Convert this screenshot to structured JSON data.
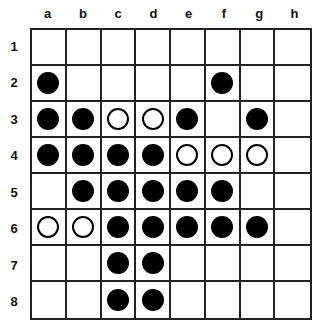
{
  "board": {
    "columns": [
      "a",
      "b",
      "c",
      "d",
      "e",
      "f",
      "g",
      "h"
    ],
    "rows": [
      "1",
      "2",
      "3",
      "4",
      "5",
      "6",
      "7",
      "8"
    ],
    "colors": {
      "black": "#000000",
      "white": "#ffffff",
      "grid": "#222222"
    },
    "cells": [
      [
        "",
        "",
        "",
        "",
        "",
        "",
        "",
        ""
      ],
      [
        "B",
        "",
        "",
        "",
        "",
        "B",
        "",
        ""
      ],
      [
        "B",
        "B",
        "W",
        "W",
        "B",
        "",
        "B",
        ""
      ],
      [
        "B",
        "B",
        "B",
        "B",
        "W",
        "W",
        "W",
        ""
      ],
      [
        "",
        "B",
        "B",
        "B",
        "B",
        "B",
        "",
        ""
      ],
      [
        "W",
        "W",
        "B",
        "B",
        "B",
        "B",
        "B",
        ""
      ],
      [
        "",
        "",
        "B",
        "B",
        "",
        "",
        "",
        ""
      ],
      [
        "",
        "",
        "B",
        "B",
        "",
        "",
        "",
        ""
      ]
    ]
  }
}
